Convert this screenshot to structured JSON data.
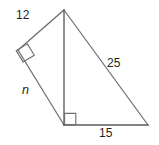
{
  "figure": {
    "background_color": "#ffffff",
    "stroke_color": "#6e6e6e",
    "label_color": "#231f20",
    "labels": {
      "upper_left_side": "12",
      "lower_left_side": "n",
      "right_hypotenuse": "25",
      "bottom_side": "15"
    },
    "vertices": {
      "apex": {
        "name": "apex-vertex",
        "x": 64,
        "y": 10
      },
      "left": {
        "name": "left-vertex",
        "x": 18,
        "y": 50
      },
      "foot": {
        "name": "altitude-foot-vertex",
        "x": 64,
        "y": 125
      },
      "right": {
        "name": "right-vertex",
        "x": 148,
        "y": 125
      }
    },
    "right_angles": [
      {
        "name": "right-angle-left-vertex",
        "at": "left"
      },
      {
        "name": "right-angle-altitude-foot",
        "at": "foot"
      }
    ],
    "segments": [
      {
        "name": "segment-apex-left",
        "label": "12"
      },
      {
        "name": "segment-left-foot",
        "label": "n"
      },
      {
        "name": "segment-apex-foot",
        "label": ""
      },
      {
        "name": "segment-apex-right",
        "label": "25"
      },
      {
        "name": "segment-foot-right",
        "label": "15"
      }
    ]
  }
}
